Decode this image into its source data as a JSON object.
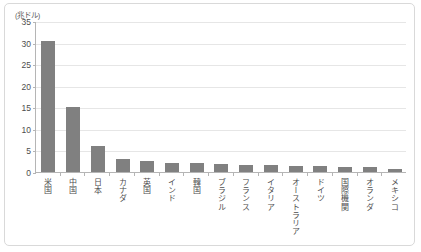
{
  "chart_data": {
    "type": "bar",
    "title": "",
    "subtitle": "",
    "xlabel": "",
    "ylabel": "",
    "unit_label": "(兆ドル)",
    "grid": true,
    "legend": null,
    "ylim": [
      0,
      35
    ],
    "yticks": [
      0,
      5,
      10,
      15,
      20,
      25,
      30,
      35
    ],
    "ytick_labels": [
      "0",
      "5",
      "10",
      "15",
      "20",
      "25",
      "30",
      "35"
    ],
    "categories": [
      "米国",
      "中国",
      "日本",
      "カナダ",
      "英国",
      "インド",
      "韓国",
      "ブラジル",
      "フランス",
      "イタリア",
      "オーストラリア",
      "ドイツ",
      "国際機関",
      "オランダ",
      "メキシコ"
    ],
    "values": [
      30.3,
      15.0,
      6.0,
      3.0,
      2.6,
      2.2,
      2.1,
      1.9,
      1.7,
      1.6,
      1.5,
      1.3,
      1.2,
      1.2,
      0.8
    ],
    "bar_color": "#808080",
    "axis_color": "#b5b5b5",
    "grid_color": "#e6e6e6",
    "frame_color": "#d9d9d9",
    "text_color": "#4d4d4d"
  }
}
